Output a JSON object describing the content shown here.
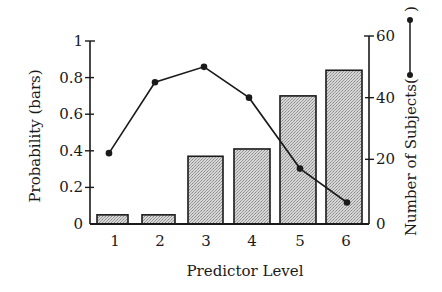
{
  "chart_data": {
    "type": "bar",
    "title": "",
    "xlabel": "Predictor Level",
    "ylabel": "Probability (bars)",
    "y2label": "Number of Subjects(",
    "y2label_close": ")",
    "categories": [
      "1",
      "2",
      "3",
      "4",
      "5",
      "6"
    ],
    "ylim": [
      0,
      1
    ],
    "y2lim": [
      0,
      60
    ],
    "y_ticks": [
      "0",
      "0.2",
      "0.4",
      "0.6",
      "0.8",
      "1"
    ],
    "y2_ticks": [
      "0",
      "20",
      "40",
      "60"
    ],
    "grid": false,
    "legend_position": "inline in right axis label",
    "series": [
      {
        "name": "Probability",
        "type": "bar",
        "axis": "left",
        "values": [
          0.05,
          0.05,
          0.37,
          0.41,
          0.7,
          0.84
        ]
      },
      {
        "name": "Number of Subjects",
        "type": "line",
        "axis": "right",
        "values": [
          22,
          45,
          50,
          40,
          17,
          6
        ]
      }
    ]
  },
  "colors": {
    "bar_fill": "#c8c8c8",
    "bar_stroke": "#1a1a1a",
    "line": "#1a1a1a",
    "axis": "#1a1a1a"
  }
}
